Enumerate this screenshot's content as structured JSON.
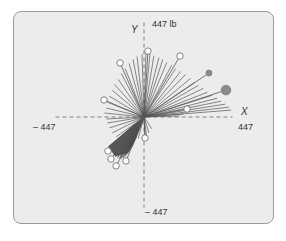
{
  "chart_data": {
    "type": "scatter",
    "subtype": "force-vector-polar-plot",
    "title": "",
    "units": "lb",
    "xlabel": "X",
    "ylabel": "Y",
    "xlim": [
      -447,
      447
    ],
    "ylim": [
      -447,
      447
    ],
    "tick_labels": {
      "x_min": "– 447",
      "x_max": "447",
      "y_min": "– 447",
      "y_max": "447 lb"
    },
    "grid": false,
    "axes_style": "dashed",
    "colors": {
      "panel_bg": "#ececec",
      "panel_border": "#9a9a9a",
      "vector_line": "#555555",
      "dense_fill": "#4a4a4a",
      "axis": "#666666",
      "marker_filled": "#8a8a8a",
      "marker_open_fill": "#ffffff"
    },
    "origin_px": [
      144,
      117
    ],
    "px_per_unit": 0.198,
    "vectors_fan_upper": [
      [
        -200,
        20
      ],
      [
        -190,
        45
      ],
      [
        -185,
        75
      ],
      [
        -175,
        105
      ],
      [
        -160,
        135
      ],
      [
        -150,
        165
      ],
      [
        -130,
        190
      ],
      [
        -115,
        220
      ],
      [
        -95,
        245
      ],
      [
        -75,
        270
      ],
      [
        -55,
        290
      ],
      [
        -35,
        305
      ],
      [
        -10,
        315
      ],
      [
        10,
        320
      ],
      [
        30,
        318
      ],
      [
        50,
        310
      ],
      [
        75,
        300
      ],
      [
        95,
        290
      ],
      [
        115,
        275
      ],
      [
        140,
        262
      ],
      [
        160,
        245
      ],
      [
        185,
        230
      ],
      [
        210,
        215
      ],
      [
        235,
        195
      ],
      [
        255,
        175
      ],
      [
        275,
        160
      ],
      [
        300,
        145
      ],
      [
        320,
        125
      ],
      [
        345,
        110
      ],
      [
        370,
        95
      ],
      [
        390,
        80
      ],
      [
        410,
        65
      ],
      [
        430,
        50
      ],
      [
        440,
        35
      ],
      [
        200,
        15
      ],
      [
        180,
        5
      ]
    ],
    "vectors_fan_lower": [
      [
        -190,
        -10
      ],
      [
        -185,
        -30
      ],
      [
        -175,
        -55
      ],
      [
        -160,
        -80
      ],
      [
        -140,
        -100
      ],
      [
        40,
        -60
      ],
      [
        25,
        -80
      ],
      [
        5,
        -90
      ],
      [
        15,
        -110
      ],
      [
        -30,
        -110
      ]
    ],
    "dense_wedge": [
      [
        0,
        0
      ],
      [
        -10,
        -30
      ],
      [
        -40,
        -110
      ],
      [
        -80,
        -180
      ],
      [
        -145,
        -200
      ],
      [
        -170,
        -165
      ],
      [
        -180,
        -150
      ],
      [
        -60,
        -45
      ]
    ],
    "markers": [
      {
        "x": 20,
        "y": 333,
        "style": "open",
        "r": 3.2
      },
      {
        "x": 182,
        "y": 308,
        "style": "open",
        "r": 3.2
      },
      {
        "x": -121,
        "y": 273,
        "style": "open",
        "r": 3.2
      },
      {
        "x": 328,
        "y": 222,
        "style": "filled",
        "r": 3.0
      },
      {
        "x": 414,
        "y": 136,
        "style": "filled",
        "r": 4.8
      },
      {
        "x": -202,
        "y": 86,
        "style": "open",
        "r": 3.2
      },
      {
        "x": 217,
        "y": 40,
        "style": "open",
        "r": 3.2
      },
      {
        "x": 5,
        "y": -106,
        "style": "open",
        "r": 3.2
      },
      {
        "x": -182,
        "y": -172,
        "style": "open",
        "r": 3.2
      },
      {
        "x": -167,
        "y": -212,
        "style": "open",
        "r": 3.2
      },
      {
        "x": -141,
        "y": -247,
        "style": "open",
        "r": 3.2
      },
      {
        "x": -91,
        "y": -222,
        "style": "open",
        "r": 3.2
      }
    ]
  },
  "labels": {
    "y_axis_name": "Y",
    "y_max": "447 lb",
    "x_axis_name": "X",
    "x_max": "447",
    "x_min": "– 447",
    "y_min": "– 447"
  }
}
